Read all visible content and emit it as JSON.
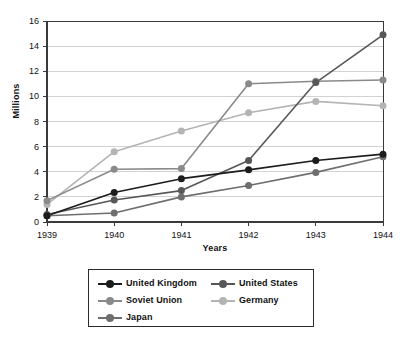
{
  "chart_data": {
    "type": "line",
    "title": "",
    "xlabel": "Years",
    "ylabel": "Millions",
    "categories": [
      "1939",
      "1940",
      "1941",
      "1942",
      "1943",
      "1944"
    ],
    "ylim": [
      0,
      16
    ],
    "yticks": [
      0,
      2,
      4,
      6,
      8,
      10,
      12,
      14,
      16
    ],
    "ytick_labels": [
      "0",
      "2",
      "4",
      "6",
      "8",
      "10",
      "12",
      "14",
      "16"
    ],
    "grid": "horizontal",
    "legend_position": "below-center",
    "series": [
      {
        "name": "United Kingdom",
        "color": "#1c1c1c",
        "values": [
          0.5,
          2.35,
          3.45,
          4.15,
          4.9,
          5.4
        ]
      },
      {
        "name": "United States",
        "color": "#575757",
        "values": [
          0.6,
          1.75,
          2.5,
          4.9,
          11.1,
          14.9
        ]
      },
      {
        "name": "Soviet Union",
        "color": "#8a8a8a",
        "values": [
          1.7,
          4.2,
          4.25,
          11.0,
          11.2,
          11.3
        ]
      },
      {
        "name": "Germany",
        "color": "#b4b4b4",
        "values": [
          1.4,
          5.6,
          7.25,
          8.7,
          9.6,
          9.25
        ]
      },
      {
        "name": "Japan",
        "color": "#6e6e6e",
        "values": [
          0.5,
          0.72,
          2.0,
          2.9,
          3.95,
          5.2
        ]
      }
    ]
  },
  "legend": {
    "columns": [
      [
        "United Kingdom",
        "Soviet Union",
        "Japan"
      ],
      [
        "United States",
        "Germany"
      ]
    ]
  },
  "colors": {
    "grid": "#d2d2d2",
    "axis": "#3a3a3a",
    "legend_border": "#2b2b2b",
    "background": "#ffffff"
  }
}
